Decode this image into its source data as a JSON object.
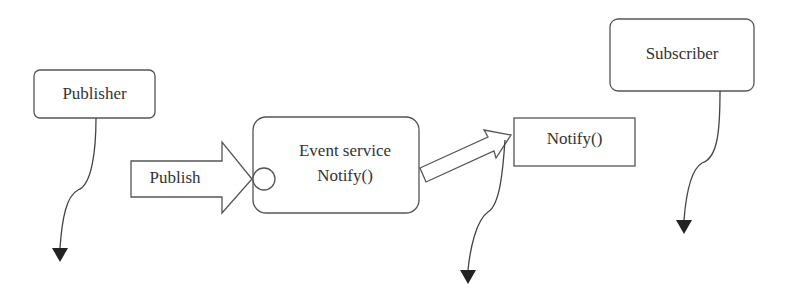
{
  "diagram": {
    "nodes": {
      "publisher": {
        "label": "Publisher"
      },
      "subscriber": {
        "label": "Subscriber"
      },
      "event_service": {
        "line1": "Event service",
        "line2": "Notify()"
      },
      "notify_box": {
        "label": "Notify()"
      },
      "publish_arrow": {
        "label": "Publish"
      }
    },
    "colors": {
      "stroke": "#555555",
      "fill": "#ffffff",
      "text": "#333333",
      "arrowhead": "#222222"
    }
  }
}
